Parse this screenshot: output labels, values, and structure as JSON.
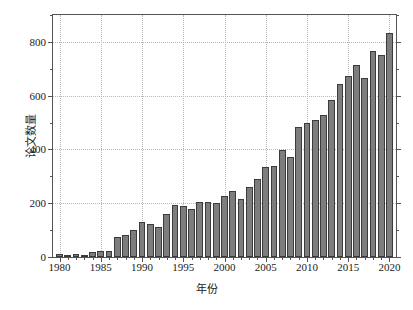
{
  "chart_data": {
    "type": "bar",
    "title": "",
    "xlabel": "年份",
    "ylabel": "论文数量",
    "xlim": [
      1979.2,
      2020.8
    ],
    "ylim": [
      0,
      900
    ],
    "grid": true,
    "legend": null,
    "bar_color": "#7d7d7d",
    "bar_edge_color": "#3b3b3b",
    "axis_color": "#555555",
    "grid_color": "#b9b9b9",
    "background": "#ffffff",
    "y_ticks_major": [
      0,
      200,
      400,
      600,
      800
    ],
    "y_tick_labels": [
      "0",
      "200",
      "400",
      "600",
      "800"
    ],
    "y_ticks_minor": [
      100,
      300,
      500,
      700,
      900
    ],
    "x_ticks_major": [
      1980,
      1985,
      1990,
      1995,
      2000,
      2005,
      2010,
      2015,
      2020
    ],
    "x_tick_labels": [
      "1980",
      "1985",
      "1990",
      "1995",
      "2000",
      "2005",
      "2010",
      "2015",
      "2020"
    ],
    "categories": [
      1980,
      1981,
      1982,
      1983,
      1984,
      1985,
      1986,
      1987,
      1988,
      1989,
      1990,
      1991,
      1992,
      1993,
      1994,
      1995,
      1996,
      1997,
      1998,
      1999,
      2000,
      2001,
      2002,
      2003,
      2004,
      2005,
      2006,
      2007,
      2008,
      2009,
      2010,
      2011,
      2012,
      2013,
      2014,
      2015,
      2016,
      2017,
      2018,
      2019,
      2020
    ],
    "values": [
      12,
      8,
      13,
      5,
      18,
      21,
      22,
      75,
      82,
      100,
      131,
      124,
      111,
      160,
      192,
      188,
      178,
      206,
      206,
      201,
      227,
      247,
      214,
      259,
      292,
      334,
      340,
      398,
      372,
      482,
      498,
      508,
      528,
      585,
      643,
      672,
      713,
      667,
      765,
      752,
      833
    ]
  }
}
